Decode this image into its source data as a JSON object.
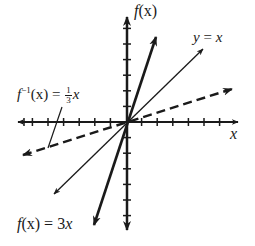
{
  "diagram": {
    "title": "",
    "axes": {
      "x_label": "x",
      "y_label": "f(x)",
      "origin_px": [
        126,
        122
      ],
      "tick_spacing_px": 15.6,
      "ticks_right": 6,
      "ticks_left": 7,
      "ticks_up": 6,
      "ticks_down": 6
    },
    "curves": [
      {
        "name": "f(x) = 3x",
        "style": "solid-thick",
        "slope": 3
      },
      {
        "name": "y = x",
        "style": "solid-thin",
        "slope": 1
      },
      {
        "name": "f^-1(x) = 1/3 x",
        "style": "dashed-thick",
        "slope": 0.3333
      }
    ],
    "labels": {
      "y_axis_f": "f",
      "y_axis_paren": "(x)",
      "x_axis": "x",
      "identity_lhs": "y",
      "identity_eq": " = ",
      "identity_rhs": "x",
      "inverse_f": "f",
      "inverse_sup": "−1",
      "inverse_arg": "(x) = ",
      "inverse_num": "1",
      "inverse_den": "3",
      "inverse_x": "x",
      "func_f": "f",
      "func_rest": "(x) = 3",
      "func_x": "x"
    },
    "colors": {
      "ink": "#1a1a1a",
      "background": "#ffffff"
    }
  }
}
